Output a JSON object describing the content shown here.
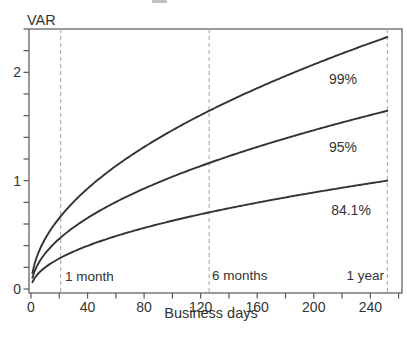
{
  "chart_data": {
    "type": "line",
    "title": "",
    "xlabel": "Business days",
    "ylabel": "VAR",
    "xlim": [
      0,
      261
    ],
    "ylim": [
      0,
      2.4
    ],
    "grid": false,
    "legend_position": "inline-right",
    "x_ticks_labeled": [
      0,
      40,
      80,
      120,
      160,
      200,
      240
    ],
    "x_minor_tick_step": 20,
    "y_ticks_labeled": [
      0,
      1,
      2
    ],
    "y_minor_tick_step": 0.2,
    "x_start": 1,
    "x_end": 252,
    "formula": "VAR = z * sqrt(t / 252)",
    "series": [
      {
        "name": "99%",
        "z_score": 2.326,
        "points": [
          [
            1,
            0.15
          ],
          [
            21,
            0.67
          ],
          [
            63,
            1.16
          ],
          [
            126,
            1.64
          ],
          [
            189,
            2.01
          ],
          [
            252,
            2.33
          ]
        ]
      },
      {
        "name": "95%",
        "z_score": 1.645,
        "points": [
          [
            1,
            0.1
          ],
          [
            21,
            0.47
          ],
          [
            63,
            0.82
          ],
          [
            126,
            1.16
          ],
          [
            189,
            1.42
          ],
          [
            252,
            1.65
          ]
        ]
      },
      {
        "name": "84.1%",
        "z_score": 1.0,
        "points": [
          [
            1,
            0.06
          ],
          [
            21,
            0.29
          ],
          [
            63,
            0.5
          ],
          [
            126,
            0.71
          ],
          [
            189,
            0.87
          ],
          [
            252,
            1.0
          ]
        ]
      }
    ],
    "reference_lines": [
      {
        "label": "1 month",
        "t_days": 21
      },
      {
        "label": "6 months",
        "t_days": 126
      },
      {
        "label": "1 year",
        "t_days": 252
      }
    ],
    "colors": {
      "curve": "#333333",
      "frame": "#555555",
      "dashed_line": "#a3a3a3",
      "text": "#333333",
      "background": "#ffffff"
    }
  }
}
